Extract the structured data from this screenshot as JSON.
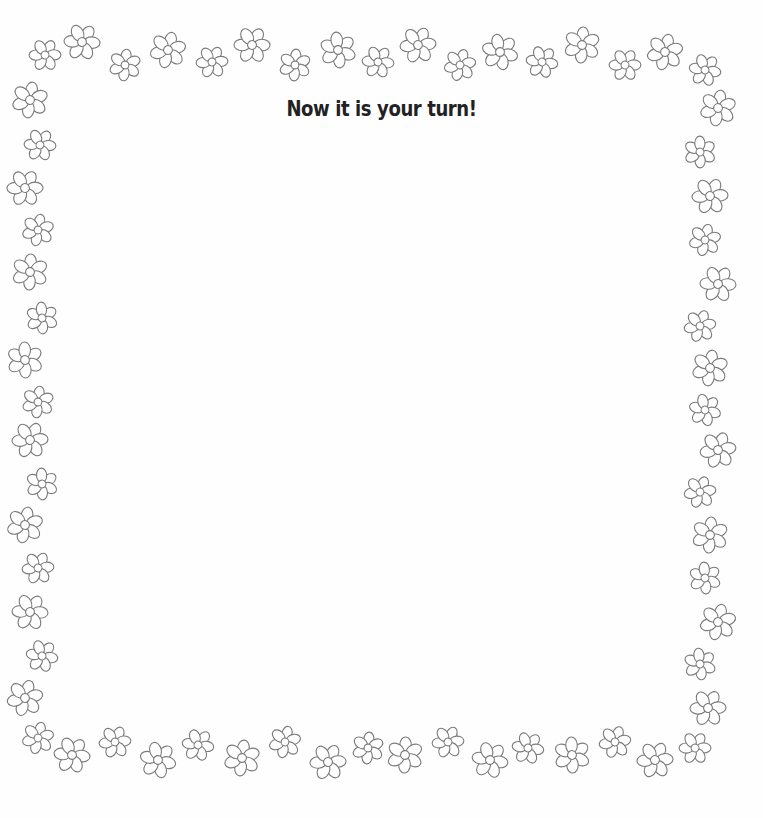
{
  "page": {
    "title": "Now it is your turn!",
    "border_style": "flower-outline",
    "colors": {
      "outline": "#7a7a7a",
      "background": "#fefefe",
      "title": "#222222"
    }
  },
  "flowers": {
    "top": [
      [
        45,
        55,
        15
      ],
      [
        82,
        42,
        17
      ],
      [
        125,
        65,
        15
      ],
      [
        168,
        50,
        17
      ],
      [
        212,
        62,
        15
      ],
      [
        252,
        45,
        17
      ],
      [
        295,
        65,
        15
      ],
      [
        338,
        50,
        17
      ],
      [
        378,
        62,
        15
      ],
      [
        418,
        45,
        17
      ],
      [
        460,
        65,
        15
      ],
      [
        500,
        52,
        17
      ],
      [
        542,
        62,
        15
      ],
      [
        582,
        45,
        17
      ],
      [
        625,
        65,
        15
      ],
      [
        665,
        52,
        17
      ],
      [
        705,
        70,
        15
      ]
    ],
    "left": [
      [
        30,
        100,
        17
      ],
      [
        40,
        145,
        15
      ],
      [
        25,
        188,
        17
      ],
      [
        38,
        230,
        15
      ],
      [
        30,
        272,
        17
      ],
      [
        42,
        318,
        15
      ],
      [
        25,
        360,
        17
      ],
      [
        38,
        402,
        15
      ],
      [
        30,
        440,
        17
      ],
      [
        42,
        484,
        15
      ],
      [
        25,
        525,
        17
      ],
      [
        38,
        568,
        15
      ],
      [
        30,
        612,
        17
      ],
      [
        42,
        656,
        15
      ],
      [
        25,
        698,
        17
      ]
    ],
    "right": [
      [
        718,
        108,
        17
      ],
      [
        700,
        152,
        15
      ],
      [
        710,
        196,
        17
      ],
      [
        705,
        240,
        15
      ],
      [
        718,
        284,
        17
      ],
      [
        700,
        326,
        15
      ],
      [
        710,
        368,
        17
      ],
      [
        705,
        410,
        15
      ],
      [
        718,
        450,
        17
      ],
      [
        700,
        492,
        15
      ],
      [
        710,
        535,
        17
      ],
      [
        705,
        578,
        15
      ],
      [
        718,
        622,
        17
      ],
      [
        700,
        664,
        15
      ],
      [
        708,
        708,
        17
      ]
    ],
    "bottom": [
      [
        38,
        738,
        15
      ],
      [
        72,
        755,
        17
      ],
      [
        115,
        742,
        15
      ],
      [
        158,
        760,
        17
      ],
      [
        198,
        745,
        15
      ],
      [
        242,
        758,
        17
      ],
      [
        285,
        742,
        15
      ],
      [
        328,
        762,
        17
      ],
      [
        368,
        748,
        15
      ],
      [
        405,
        755,
        17
      ],
      [
        448,
        742,
        15
      ],
      [
        490,
        760,
        17
      ],
      [
        528,
        748,
        15
      ],
      [
        572,
        755,
        17
      ],
      [
        615,
        742,
        15
      ],
      [
        655,
        760,
        17
      ],
      [
        695,
        748,
        15
      ]
    ]
  }
}
